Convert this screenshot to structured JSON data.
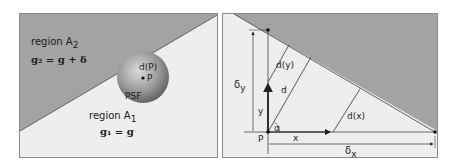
{
  "colors": {
    "shaded_region": "#a3a3a3",
    "light_region": "#eeeeee",
    "border": "#8a8a8a",
    "line": "#2b2b2b",
    "sphere_light": "#d8d8d8",
    "sphere_dark": "#6f6f6f"
  },
  "left_diagram": {
    "region_a2": {
      "label": "region A",
      "subscript": "2",
      "formula": "g₂ = g + δ"
    },
    "region_a1": {
      "label": "region A",
      "subscript": "1",
      "formula": "g₁ = g"
    },
    "psf": {
      "label": "PSF",
      "distance_label": "d(P)",
      "point_label": "P"
    }
  },
  "right_diagram": {
    "labels": {
      "delta_y": "δ",
      "delta_y_sub": "y",
      "delta_x": "δ",
      "delta_x_sub": "x",
      "d_y": "d(y)",
      "d": "d",
      "d_x": "d(x)",
      "y": "y",
      "x": "x",
      "alpha": "α",
      "p": "P"
    }
  }
}
